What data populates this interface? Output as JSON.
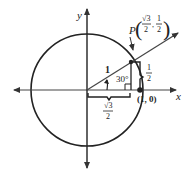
{
  "diagram": {
    "type": "unit-circle",
    "axes": {
      "x_label": "x",
      "y_label": "y"
    },
    "point_P": {
      "label": "P",
      "x_num": "√3",
      "x_den": "2",
      "y_num": "1",
      "y_den": "2"
    },
    "point_unit": {
      "label": "(1, 0)"
    },
    "hypotenuse_label": "1",
    "angle_label": "30°",
    "adjacent_label": {
      "num": "√3",
      "den": "2"
    },
    "opposite_label": {
      "num": "1",
      "den": "2"
    },
    "colors": {
      "stroke": "#222222",
      "background": "#ffffff"
    }
  }
}
